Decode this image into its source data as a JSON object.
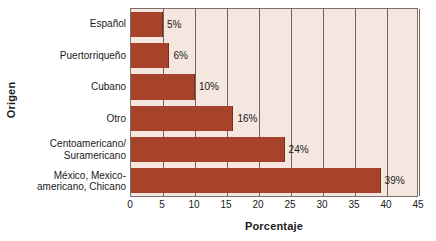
{
  "chart_data": {
    "type": "bar",
    "orientation": "horizontal",
    "title": "",
    "xlabel": "Porcentaje",
    "ylabel": "Origen",
    "xlim": [
      0,
      45
    ],
    "xticks": [
      0,
      5,
      10,
      15,
      20,
      25,
      30,
      35,
      40,
      45
    ],
    "xtick_labels": [
      "0",
      "5",
      "10",
      "15",
      "20",
      "25",
      "30",
      "35",
      "40",
      "45"
    ],
    "grid": true,
    "legend": null,
    "categories": [
      "Español",
      "Puertorriqueño",
      "Cubano",
      "Otro",
      "Centoamericano/\nSuramericano",
      "México, Mexico-\namericano, Chicano"
    ],
    "values": [
      5,
      6,
      10,
      16,
      24,
      39
    ],
    "value_labels": [
      "5%",
      "6%",
      "10%",
      "16%",
      "24%",
      "39%"
    ],
    "colors": {
      "bar": "#a8432b",
      "bar_edge": "#7a2f1d",
      "plot_background": "#f5e7df",
      "grid": "#6f635a",
      "axis": "#7d7066",
      "page_background": "#ffffff",
      "text": "#1a1a1a"
    }
  }
}
